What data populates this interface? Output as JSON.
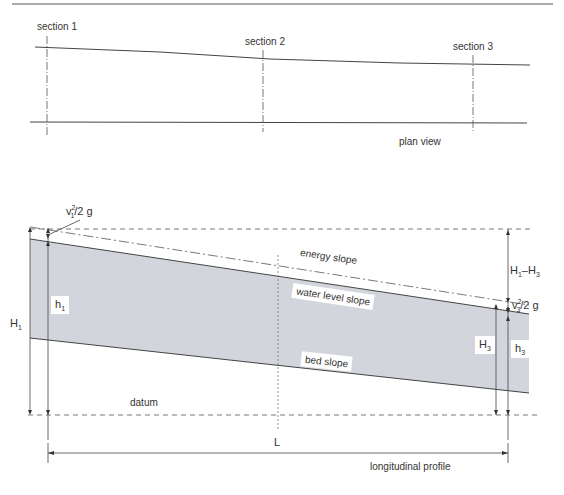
{
  "plan_view": {
    "caption": "plan view",
    "sections": [
      {
        "label": "section 1"
      },
      {
        "label": "section 2"
      },
      {
        "label": "section 3"
      }
    ]
  },
  "profile": {
    "caption": "longitudinal profile",
    "energy_label": "energy slope",
    "water_label": "water level slope",
    "bed_label": "bed slope",
    "datum_label": "datum",
    "length_label": "L",
    "H1": "H",
    "H1_sub": "1",
    "h1": "h",
    "h1_sub": "1",
    "H3": "H",
    "H3_sub": "3",
    "h3": "h",
    "h3_sub": "3",
    "v1_head": "v",
    "v1_sub": "1",
    "v1_rest": "/2 g",
    "v3_head": "v",
    "v3_sub": "3",
    "v3_rest": "/2 g",
    "diff_label": "H",
    "diff_sub1": "1",
    "diff_mid": "–H",
    "diff_sub2": "3",
    "sup": "2"
  },
  "colors": {
    "water_fill": "#d3d5dd",
    "line": "#444444"
  }
}
